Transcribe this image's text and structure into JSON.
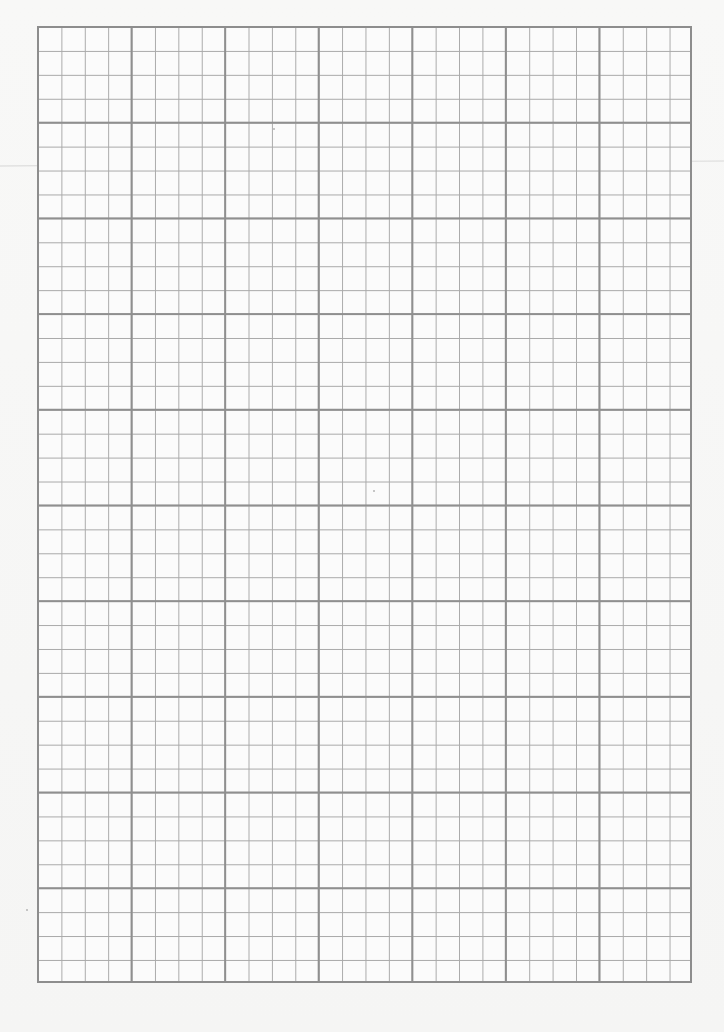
{
  "document": {
    "type": "graph-paper-sheet",
    "grid": {
      "major_columns": 7,
      "major_rows": 10,
      "minor_divisions_per_major": 4,
      "minor_columns": 28,
      "minor_rows": 40,
      "major_line_color": "#8f8f8f",
      "minor_line_color": "#a9a9a9",
      "paper_color": "#f7f7f6"
    }
  }
}
